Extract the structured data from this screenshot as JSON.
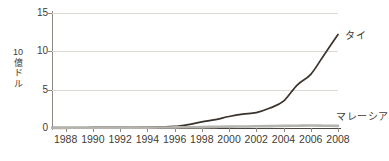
{
  "chart_data": {
    "type": "line",
    "title": "",
    "xlabel": "",
    "ylabel": "10億ドル",
    "ylabel_chars": "10\n億\nド\nル",
    "xlim": [
      1987,
      2008
    ],
    "ylim": [
      0,
      15
    ],
    "yticks": [
      0,
      5,
      10,
      15
    ],
    "xticks": [
      1988,
      1990,
      1992,
      1994,
      1996,
      1998,
      2000,
      2002,
      2004,
      2006,
      2008
    ],
    "grid": "horizontal",
    "legend_position": "inline-right",
    "x": [
      1987,
      1988,
      1989,
      1990,
      1991,
      1992,
      1993,
      1994,
      1995,
      1996,
      1997,
      1998,
      1999,
      2000,
      2001,
      2002,
      2003,
      2004,
      2005,
      2006,
      2007,
      2008
    ],
    "series": [
      {
        "name": "タイ",
        "color": "#3a332d",
        "values": [
          0.05,
          0.05,
          0.06,
          0.07,
          0.08,
          0.09,
          0.1,
          0.12,
          0.15,
          0.2,
          0.45,
          0.8,
          1.1,
          1.5,
          1.8,
          2.0,
          2.6,
          3.5,
          5.6,
          7.0,
          9.6,
          12.2
        ]
      },
      {
        "name": "マレーシア",
        "color": "#b5b3ad",
        "values": [
          0.02,
          0.02,
          0.03,
          0.03,
          0.04,
          0.04,
          0.05,
          0.05,
          0.06,
          0.08,
          0.1,
          0.12,
          0.15,
          0.18,
          0.2,
          0.22,
          0.25,
          0.28,
          0.3,
          0.32,
          0.3,
          0.28
        ]
      }
    ]
  },
  "axis": {
    "y_tick_labels": [
      "15",
      "10",
      "5",
      "0"
    ],
    "x_tick_labels": [
      "1988",
      "1990",
      "1992",
      "1994",
      "1996",
      "1998",
      "2000",
      "2002",
      "2004",
      "2006",
      "2008"
    ]
  },
  "labels": {
    "thailand": "タイ",
    "malaysia": "マレーシア"
  },
  "colors": {
    "thailand_line": "#3a332d",
    "malaysia_line": "#b5b3ad",
    "gridline": "#ddd9d2",
    "axis": "#4a453f",
    "text": "#3f3b36",
    "background": "#ffffff"
  }
}
